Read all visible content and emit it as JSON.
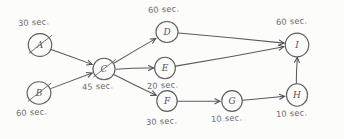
{
  "diagram": {
    "canvas": {
      "width": 344,
      "height": 139,
      "background": "#fcfcfb"
    },
    "ink_color": "#5a5a5e",
    "label_color": "#6a6a6e",
    "nodes": [
      {
        "id": "A",
        "letter": "A",
        "cx": 40,
        "cy": 45,
        "r": 11.5,
        "duration": "30 sec.",
        "label_x": 18,
        "label_y": 18,
        "struck": true
      },
      {
        "id": "B",
        "letter": "B",
        "cx": 39,
        "cy": 93,
        "r": 11.5,
        "duration": "60 sec.",
        "label_x": 16,
        "label_y": 108,
        "struck": true
      },
      {
        "id": "C",
        "letter": "C",
        "cx": 104,
        "cy": 69,
        "r": 11.0,
        "duration": "45 sec.",
        "label_x": 82,
        "label_y": 82,
        "struck": true
      },
      {
        "id": "D",
        "letter": "D",
        "cx": 167,
        "cy": 32,
        "r": 11.0,
        "duration": "60 sec.",
        "label_x": 148,
        "label_y": 5,
        "struck": false
      },
      {
        "id": "E",
        "letter": "E",
        "cx": 165,
        "cy": 68,
        "r": 10.5,
        "duration": "20 sec.",
        "label_x": 147,
        "label_y": 81,
        "struck": false
      },
      {
        "id": "F",
        "letter": "F",
        "cx": 167,
        "cy": 101,
        "r": 10.5,
        "duration": "30 sec.",
        "label_x": 146,
        "label_y": 117,
        "struck": false
      },
      {
        "id": "G",
        "letter": "G",
        "cx": 232,
        "cy": 101,
        "r": 10.5,
        "duration": "10 sec.",
        "label_x": 211,
        "label_y": 114,
        "struck": false
      },
      {
        "id": "H",
        "letter": "H",
        "cx": 297,
        "cy": 95,
        "r": 11.0,
        "duration": "10 sec.",
        "label_x": 276,
        "label_y": 109,
        "struck": false
      },
      {
        "id": "I",
        "letter": "I",
        "cx": 297,
        "cy": 45,
        "r": 11.5,
        "duration": "60 sec.",
        "label_x": 276,
        "label_y": 17,
        "struck": false
      }
    ],
    "edges": [
      {
        "from": "A",
        "to": "C"
      },
      {
        "from": "B",
        "to": "C"
      },
      {
        "from": "C",
        "to": "D"
      },
      {
        "from": "C",
        "to": "E"
      },
      {
        "from": "C",
        "to": "F"
      },
      {
        "from": "D",
        "to": "I"
      },
      {
        "from": "E",
        "to": "I"
      },
      {
        "from": "F",
        "to": "G"
      },
      {
        "from": "G",
        "to": "H"
      },
      {
        "from": "H",
        "to": "I"
      }
    ]
  }
}
